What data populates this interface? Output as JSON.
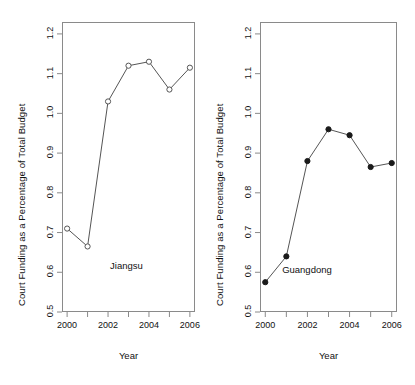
{
  "figure": {
    "background": "#ffffff",
    "axis_color": "#8a8a8a",
    "line_color": "#555555",
    "text_color": "#111111"
  },
  "chart_data": [
    {
      "type": "line",
      "title": "",
      "panel_label": "Jiangsu",
      "xlabel": "Year",
      "ylabel": "Court Funding as a Percentage of Total Budget",
      "x": [
        2000,
        2001,
        2002,
        2003,
        2004,
        2005,
        2006
      ],
      "values": [
        0.71,
        0.665,
        1.03,
        1.12,
        1.13,
        1.06,
        1.115
      ],
      "marker": "open-circle",
      "xlim": [
        1999.75,
        2006.25
      ],
      "ylim": [
        0.5,
        1.23
      ],
      "yticks": [
        0.5,
        0.6,
        0.7,
        0.8,
        0.9,
        1.0,
        1.1,
        1.2
      ],
      "ytick_labels": [
        "0.5",
        "0.6",
        "0.7",
        "0.8",
        "0.9",
        "1.0",
        "1.1",
        "1.2"
      ],
      "xticks": [
        2000,
        2001,
        2002,
        2003,
        2004,
        2005,
        2006
      ],
      "xtick_labels": [
        "2000",
        "",
        "2002",
        "",
        "2004",
        "",
        "2006"
      ],
      "grid": false,
      "legend": "none"
    },
    {
      "type": "line",
      "title": "",
      "panel_label": "Guangdong",
      "xlabel": "Year",
      "ylabel": "Court Funding as a Percentage of Total Budget",
      "x": [
        2000,
        2001,
        2002,
        2003,
        2004,
        2005,
        2006
      ],
      "values": [
        0.575,
        0.64,
        0.88,
        0.96,
        0.945,
        0.865,
        0.875
      ],
      "marker": "filled-circle",
      "xlim": [
        1999.75,
        2006.25
      ],
      "ylim": [
        0.5,
        1.23
      ],
      "yticks": [
        0.5,
        0.6,
        0.7,
        0.8,
        0.9,
        1.0,
        1.1,
        1.2
      ],
      "ytick_labels": [
        "0.5",
        "0.6",
        "0.7",
        "0.8",
        "0.9",
        "1.0",
        "1.1",
        "1.2"
      ],
      "xticks": [
        2000,
        2001,
        2002,
        2003,
        2004,
        2005,
        2006
      ],
      "xtick_labels": [
        "2000",
        "",
        "2002",
        "",
        "2004",
        "",
        "2006"
      ],
      "grid": false,
      "legend": "none"
    }
  ]
}
